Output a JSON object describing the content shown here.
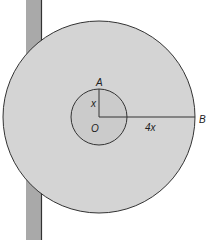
{
  "diagram": {
    "type": "concentric-circles",
    "labels": {
      "point_a": "A",
      "point_b": "B",
      "center": "O",
      "inner_radius": "x",
      "outer_segment": "4x"
    },
    "colors": {
      "disk_fill": "#d4d4d4",
      "inner_fill": "#cbcbcb",
      "stroke": "#333333",
      "pole_fill": "#a9a9a9",
      "background": "#ffffff"
    }
  }
}
